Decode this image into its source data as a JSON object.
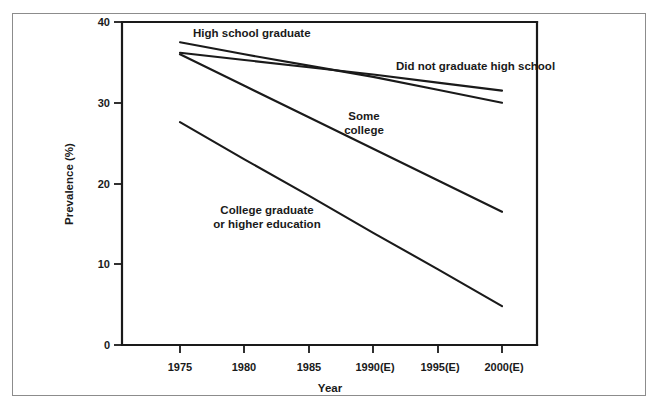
{
  "chart_data": {
    "type": "line",
    "title": "",
    "xlabel": "Year",
    "ylabel": "Prevalence (%)",
    "x": [
      1975,
      1980,
      1985,
      1990,
      1995,
      2000
    ],
    "xtick_labels": [
      "1975",
      "1980",
      "1985",
      "1990(E)",
      "1995(E)",
      "2000(E)"
    ],
    "ytick_labels": [
      "0",
      "10",
      "20",
      "30",
      "40"
    ],
    "ytick_values": [
      0,
      10,
      20,
      30,
      40
    ],
    "ylim": [
      0,
      40
    ],
    "xlim": [
      1972.5,
      2002.5
    ],
    "grid": false,
    "legend_position": "inline-annotations",
    "series": [
      {
        "name": "High school graduate",
        "label": "High school graduate",
        "values": [
          37.5,
          36.0,
          34.6,
          33.2,
          31.6,
          30.0
        ],
        "color": "#1a1a1a"
      },
      {
        "name": "Did not graduate high school",
        "label": "Did not graduate high school",
        "values": [
          36.2,
          35.3,
          34.4,
          33.5,
          32.5,
          31.5
        ],
        "color": "#1a1a1a"
      },
      {
        "name": "Some college",
        "label": "Some college",
        "values": [
          36.0,
          32.1,
          28.2,
          24.3,
          20.4,
          16.5
        ],
        "color": "#1a1a1a"
      },
      {
        "name": "College graduate or higher education",
        "label": "College graduate\nor higher education",
        "values": [
          27.6,
          23.0,
          18.5,
          13.9,
          9.4,
          4.8
        ],
        "color": "#1a1a1a"
      }
    ],
    "annotations": [
      {
        "text": "High school graduate",
        "series": "High school graduate"
      },
      {
        "text": "Did not graduate high school",
        "series": "Did not graduate high school"
      },
      {
        "text": "Some college",
        "series": "Some college"
      },
      {
        "text": "College graduate",
        "series": "College graduate or higher education"
      },
      {
        "text": "or higher education",
        "series": "College graduate or higher education"
      }
    ]
  },
  "labels": {
    "y_axis_title": "Prevalence (%)",
    "x_axis_title": "Year",
    "y_40": "40",
    "y_30": "30",
    "y_20": "20",
    "y_10": "10",
    "y_0": "0",
    "x_1975": "1975",
    "x_1980": "1980",
    "x_1985": "1985",
    "x_1990": "1990(E)",
    "x_1995": "1995(E)",
    "x_2000": "2000(E)",
    "series_hs_grad": "High school graduate",
    "series_no_hs": "Did not graduate high school",
    "series_some_college_l1": "Some",
    "series_some_college_l2": "college",
    "series_college_grad_l1": "College graduate",
    "series_college_grad_l2": "or higher education"
  },
  "colors": {
    "line": "#1a1a1a",
    "axis": "#1a1a1a",
    "frame": "#8c8c8c",
    "background": "#ffffff"
  }
}
